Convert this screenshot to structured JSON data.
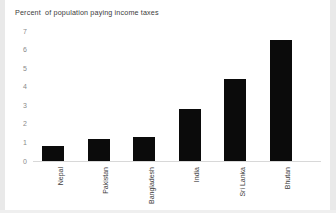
{
  "chart_data": {
    "type": "bar",
    "title": "Percent  of population paying income taxes",
    "xlabel": "",
    "ylabel": "",
    "categories": [
      "Nepal",
      "Pakistan",
      "Bangladesh",
      "India",
      "Sri Lanka",
      "Bhutan"
    ],
    "values": [
      0.8,
      1.2,
      1.3,
      2.8,
      4.4,
      6.5
    ],
    "ylim": [
      0,
      7
    ],
    "ytick_labels": [
      "7",
      "6",
      "5",
      "4",
      "3",
      "2",
      "1",
      "0"
    ],
    "ytick_values": [
      7,
      6,
      5,
      4,
      3,
      2,
      1,
      0
    ],
    "grid": false,
    "legend": false,
    "bar_color": "#0b0b0b",
    "axis_color": "#d8d8d8",
    "tick_label_color": "#8a8a8a",
    "title_color": "#3b3b3b",
    "background_color": "#ffffff",
    "xtick_label_rotation": "90"
  }
}
